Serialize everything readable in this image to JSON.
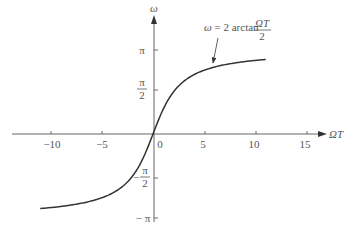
{
  "chart_data": {
    "type": "line",
    "title": "",
    "xlabel": "ΩT",
    "ylabel": "ω",
    "annotation": {
      "text_lhs": "ω = 2 arctan",
      "frac_num": "ΩT",
      "frac_den": "2"
    },
    "x_ticks": [
      "−10",
      "−5",
      "0",
      "5",
      "10",
      "15"
    ],
    "y_ticks": [
      {
        "label": "π",
        "value": 3.1416
      },
      {
        "label_num": "π",
        "label_den": "2",
        "value": 1.5708
      },
      {
        "label_num": "π",
        "label_den": "2",
        "sign": "−",
        "value": -1.5708
      },
      {
        "label": "− π",
        "value": -3.1416
      }
    ],
    "xlim": [
      -14,
      16
    ],
    "ylim": [
      -3.5,
      4.5
    ],
    "grid": false,
    "series": [
      {
        "name": "ω = 2 arctan(ΩT/2)",
        "x": [
          -11,
          -10,
          -8,
          -6,
          -4,
          -3,
          -2,
          -1,
          0,
          1,
          2,
          3,
          4,
          6,
          8,
          10,
          11
        ],
        "y": [
          -2.781,
          -2.747,
          -2.652,
          -2.498,
          -2.214,
          -1.966,
          -1.571,
          -0.927,
          0,
          0.927,
          1.571,
          1.966,
          2.214,
          2.498,
          2.652,
          2.747,
          2.781
        ]
      }
    ]
  }
}
